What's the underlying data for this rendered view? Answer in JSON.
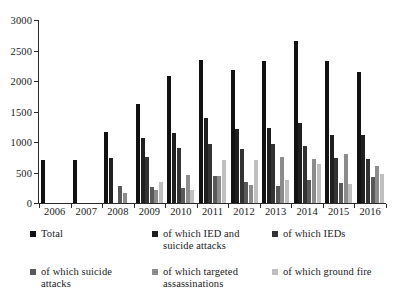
{
  "chart_data": {
    "type": "bar",
    "title": "",
    "subtitle": "",
    "xlabel": "",
    "ylabel": "",
    "ylim": [
      0,
      3000
    ],
    "yticks": [
      0,
      500,
      1000,
      1500,
      2000,
      2500,
      3000
    ],
    "ytick_labels": [
      "0",
      "500",
      "1000",
      "1500",
      "2000",
      "2500",
      "3000"
    ],
    "grid": false,
    "legend_position": "bottom",
    "categories": [
      "2006",
      "2007",
      "2008",
      "2009",
      "2010",
      "2011",
      "2012",
      "2013",
      "2014",
      "2015",
      "2016"
    ],
    "series": [
      {
        "name": "Total",
        "color": "#111111",
        "values": [
          700,
          700,
          1170,
          1630,
          2080,
          2340,
          2180,
          2320,
          2650,
          2320,
          2150
        ]
      },
      {
        "name": "of which IED and suicide attacks",
        "color": "#1f1f1f",
        "values": [
          0,
          0,
          730,
          1060,
          1150,
          1400,
          1210,
          1230,
          1310,
          1120,
          1110
        ]
      },
      {
        "name": "of which IEDs",
        "color": "#333333",
        "values": [
          0,
          0,
          0,
          760,
          910,
          970,
          880,
          970,
          930,
          730,
          720
        ]
      },
      {
        "name": "of which suicide attacks",
        "color": "#595959",
        "values": [
          0,
          0,
          280,
          260,
          240,
          440,
          340,
          280,
          380,
          330,
          420
        ]
      },
      {
        "name": "of which targeted assassinations",
        "color": "#8c8c8c",
        "values": [
          0,
          0,
          170,
          220,
          460,
          450,
          290,
          750,
          720,
          800,
          600
        ]
      },
      {
        "name": "of which ground fire",
        "color": "#bfbfbf",
        "values": [
          0,
          0,
          0,
          350,
          210,
          710,
          710,
          370,
          640,
          310,
          480
        ]
      }
    ]
  },
  "legend": {
    "items": [
      {
        "label": "Total",
        "color": "#111111"
      },
      {
        "label": "of which IED and suicide attacks",
        "color": "#1f1f1f"
      },
      {
        "label": "of which IEDs",
        "color": "#333333"
      },
      {
        "label": "of which suicide attacks",
        "color": "#595959"
      },
      {
        "label": "of which targeted assassinations",
        "color": "#8c8c8c"
      },
      {
        "label": "of which ground fire",
        "color": "#bfbfbf"
      }
    ]
  }
}
